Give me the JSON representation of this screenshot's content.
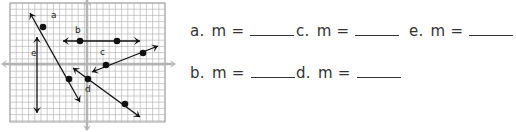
{
  "graph": {
    "grid": {
      "left": 10,
      "top": 3,
      "right": 165,
      "bottom": 122,
      "cell": 6.2,
      "line_color": "#b8b8b8",
      "border_color": "#a0a0a0"
    },
    "axes": {
      "x_axis_y": 64,
      "y_axis_x": 87,
      "color": "#b4b4b4"
    },
    "lines": [
      {
        "label": "a",
        "x1": 30,
        "y1": 13,
        "x2": 80,
        "y2": 102,
        "points": [
          [
            43,
            27
          ],
          [
            69,
            79
          ]
        ],
        "label_pos": [
          51,
          18
        ]
      },
      {
        "label": "b",
        "x1": 63,
        "y1": 41,
        "x2": 140,
        "y2": 41,
        "points": [
          [
            80,
            41
          ],
          [
            117,
            41
          ]
        ],
        "label_pos": [
          75,
          33
        ]
      },
      {
        "label": "c",
        "x1": 92,
        "y1": 72,
        "x2": 158,
        "y2": 46,
        "points": [
          [
            106,
            65
          ],
          [
            143,
            53
          ]
        ],
        "label_pos": [
          100,
          55
        ]
      },
      {
        "label": "d",
        "x1": 73,
        "y1": 68,
        "x2": 140,
        "y2": 117,
        "points": [
          [
            88,
            79
          ],
          [
            125,
            104
          ]
        ],
        "label_pos": [
          85,
          92
        ]
      },
      {
        "label": "e",
        "x1": 37,
        "y1": 37,
        "x2": 37,
        "y2": 113,
        "points": [],
        "label_pos": [
          31,
          56
        ]
      }
    ],
    "line_color": "#111111"
  },
  "answers": [
    {
      "label": "a.",
      "text": "m =",
      "x": 190,
      "y": 22
    },
    {
      "label": "c.",
      "text": "m =",
      "x": 296,
      "y": 22
    },
    {
      "label": "e.",
      "text": "m =",
      "x": 409,
      "y": 22
    },
    {
      "label": "b.",
      "text": "m =",
      "x": 190,
      "y": 64
    },
    {
      "label": "d.",
      "text": "m =",
      "x": 296,
      "y": 64
    }
  ]
}
